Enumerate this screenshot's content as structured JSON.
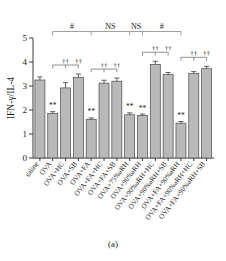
{
  "figure": {
    "caption": "(a)",
    "panel_label": "(a)"
  },
  "chart_data": {
    "type": "bar",
    "title": "",
    "xlabel": "",
    "ylabel": "IFN-γ/IL-4",
    "ylim": [
      0,
      5
    ],
    "ytick_labels": [
      "0",
      "1",
      "2",
      "3",
      "4",
      "5"
    ],
    "ytick_values": [
      0,
      1,
      2,
      3,
      4,
      5
    ],
    "grid": false,
    "legend": "none",
    "categories": [
      "saline",
      "OVA",
      "OVA+HC",
      "OVA+SB",
      "OVA+FA",
      "OVA+FA+HC",
      "OVA+FA+SB",
      "OVA+75%aRH",
      "OVA+90%aRH",
      "OVA+90%aRH+HC",
      "OVA+90%aRH+SB",
      "OVA+FA+90%aRH",
      "OVA+FA+90%aRH+HC",
      "OVA+FA+90%aRH+SB"
    ],
    "values": [
      3.25,
      1.85,
      2.92,
      3.35,
      1.6,
      3.12,
      3.2,
      1.8,
      1.77,
      3.9,
      3.48,
      1.45,
      3.52,
      3.72
    ],
    "errors": [
      0.13,
      0.08,
      0.22,
      0.15,
      0.07,
      0.12,
      0.13,
      0.08,
      0.06,
      0.13,
      0.08,
      0.07,
      0.08,
      0.1
    ],
    "bar_significance": [
      "",
      "**",
      "",
      "",
      "**",
      "",
      "",
      "**",
      "**",
      "",
      "",
      "**",
      "",
      ""
    ],
    "significance_legend": {
      "double_asterisk": "**",
      "double_dagger": "††",
      "hash": "#",
      "ns": "NS"
    },
    "dagger_brackets": [
      {
        "from": "OVA",
        "to": [
          "OVA+HC",
          "OVA+SB"
        ],
        "marks": [
          "††",
          "††"
        ]
      },
      {
        "from": "OVA+FA",
        "to": [
          "OVA+FA+HC",
          "OVA+FA+SB"
        ],
        "marks": [
          "††",
          "††"
        ]
      },
      {
        "from": "OVA+90%aRH",
        "to": [
          "OVA+90%aRH+HC",
          "OVA+90%aRH+SB"
        ],
        "marks": [
          "††",
          "††"
        ]
      },
      {
        "from": "OVA+FA+90%aRH",
        "to": [
          "OVA+FA+90%aRH+HC",
          "OVA+FA+90%aRH+SB"
        ],
        "marks": [
          "††",
          "††"
        ]
      }
    ],
    "top_comparisons": [
      {
        "label": "#",
        "between": [
          "OVA",
          "OVA+FA"
        ]
      },
      {
        "label": "NS",
        "between": [
          "OVA+FA",
          "OVA+75%aRH"
        ]
      },
      {
        "label": "NS",
        "between": [
          "OVA+75%aRH",
          "OVA+90%aRH"
        ]
      },
      {
        "label": "#",
        "between": [
          "OVA+90%aRH",
          "OVA+FA+90%aRH"
        ]
      }
    ],
    "colors": {
      "bar_fill": "#b9b9b9",
      "bar_stroke": "#4a4a4a",
      "axis": "#3a3a3a",
      "text": "#1b1b1b",
      "bracket": "#6a6a6a"
    }
  }
}
